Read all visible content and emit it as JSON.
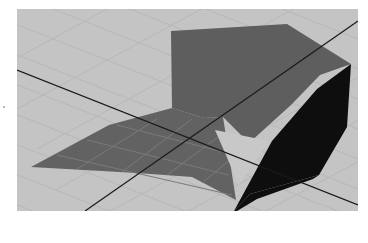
{
  "viewport": {
    "name": "3d-perspective-viewport",
    "background_color": "#c4c4c4",
    "grid_color": "#b8b8b8",
    "axis_line_color": "#1a1a1a",
    "objects": [
      {
        "name": "upper-gray-face",
        "color": "#5e5e5e"
      },
      {
        "name": "lower-gray-plane",
        "color": "#626262"
      },
      {
        "name": "black-face",
        "color": "#0e0e0e"
      }
    ]
  }
}
